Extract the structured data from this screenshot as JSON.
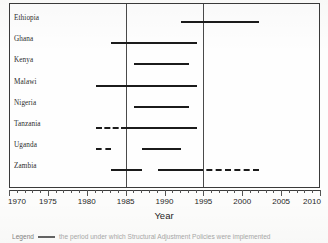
{
  "chart_data": {
    "type": "bar",
    "title": "",
    "xlabel": "Year",
    "ylabel": "",
    "xlim": [
      1970,
      2010
    ],
    "xticks": [
      1970,
      1975,
      1980,
      1985,
      1990,
      1995,
      2000,
      2005,
      2010
    ],
    "xtick_labels": [
      "1970",
      "1975",
      "1980",
      "1985",
      "1990",
      "1995",
      "2000",
      "2005",
      "2010"
    ],
    "minor_tick_step": 1,
    "grid": false,
    "reference_lines": [
      1985,
      1995
    ],
    "categories": [
      "Ethiopia",
      "Ghana",
      "Kenya",
      "Malawi",
      "Nigeria",
      "Tanzania",
      "Uganda",
      "Zambia"
    ],
    "series": [
      {
        "name": "Structural Adjustment Policies period",
        "style": "solid",
        "spans": [
          {
            "category": "Ethiopia",
            "start": 1992,
            "end": 2002,
            "style": "solid"
          },
          {
            "category": "Ghana",
            "start": 1983,
            "end": 1994,
            "style": "solid"
          },
          {
            "category": "Kenya",
            "start": 1986,
            "end": 1993,
            "style": "solid"
          },
          {
            "category": "Malawi",
            "start": 1981,
            "end": 1994,
            "style": "solid"
          },
          {
            "category": "Nigeria",
            "start": 1986,
            "end": 1993,
            "style": "solid"
          },
          {
            "category": "Tanzania",
            "start": 1981,
            "end": 1985,
            "style": "dashed"
          },
          {
            "category": "Tanzania",
            "start": 1985,
            "end": 1994,
            "style": "solid"
          },
          {
            "category": "Uganda",
            "start": 1981,
            "end": 1983,
            "style": "dashed"
          },
          {
            "category": "Uganda",
            "start": 1987,
            "end": 1992,
            "style": "solid"
          },
          {
            "category": "Zambia",
            "start": 1983,
            "end": 1987,
            "style": "solid"
          },
          {
            "category": "Zambia",
            "start": 1989,
            "end": 1994,
            "style": "solid"
          },
          {
            "category": "Zambia",
            "start": 1994,
            "end": 2002,
            "style": "dashed"
          }
        ]
      }
    ]
  },
  "legend": {
    "word": "Legend",
    "text": "the period under which Structural Adjustment Policies were implemented"
  }
}
